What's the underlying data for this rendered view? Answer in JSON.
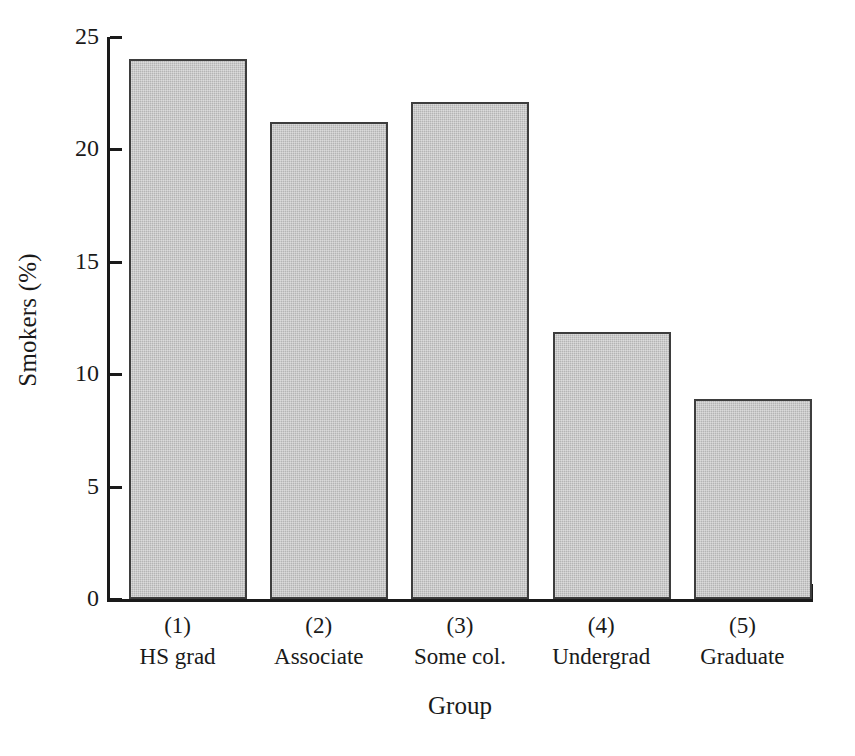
{
  "chart_data": {
    "type": "bar",
    "title": "",
    "xlabel": "Group",
    "ylabel": "Smokers (%)",
    "categories": [
      "(1)",
      "(2)",
      "(3)",
      "(4)",
      "(5)"
    ],
    "category_names": [
      "HS grad",
      "Associate",
      "Some col.",
      "Undergrad",
      "Graduate"
    ],
    "values": [
      24.0,
      21.2,
      22.1,
      11.9,
      8.9
    ],
    "ylim": [
      0,
      25
    ],
    "yticks": [
      0,
      5,
      10,
      15,
      20,
      25
    ],
    "ytick_labels": [
      "0",
      "5",
      "10",
      "15",
      "20",
      "25"
    ],
    "grid": false,
    "legend": false,
    "bar_fill_color": "#b4b4b4",
    "bar_edge_color": "#3d3d3d",
    "axis_color": "#1a1a1a",
    "background_color": "#ffffff"
  },
  "axes": {
    "y_title": "Smokers (%)",
    "x_title": "Group"
  },
  "bars": [
    {
      "key": "bar-1",
      "category": "(1)",
      "name": "HS grad",
      "value": 24.0
    },
    {
      "key": "bar-2",
      "category": "(2)",
      "name": "Associate",
      "value": 21.2
    },
    {
      "key": "bar-3",
      "category": "(3)",
      "name": "Some col.",
      "value": 22.1
    },
    {
      "key": "bar-4",
      "category": "(4)",
      "name": "Undergrad",
      "value": 11.9
    },
    {
      "key": "bar-5",
      "category": "(5)",
      "name": "Graduate",
      "value": 8.9
    }
  ]
}
